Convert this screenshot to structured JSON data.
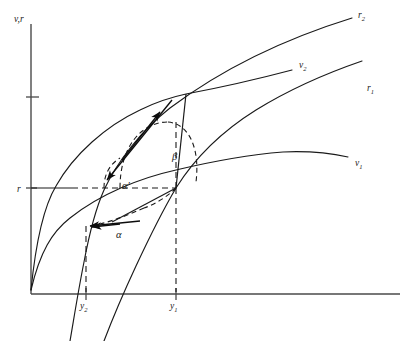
{
  "figure": {
    "type": "economics-line-diagram",
    "background_color": "#ffffff",
    "ink_color": "#1a1a1a",
    "axis_color": "#4a4a4a",
    "axes": {
      "y_axis_label": "v,r",
      "x_axis_label": "",
      "origin_label": ""
    },
    "y_ticks": [
      {
        "id": "tick-upper",
        "label": "",
        "y_px": 97
      },
      {
        "id": "tick-r",
        "label": "r",
        "y_px": 188
      }
    ],
    "x_ticks": [
      {
        "id": "tick-y2",
        "label_base": "y",
        "label_sub": "2",
        "x_px": 86
      },
      {
        "id": "tick-y1",
        "label_base": "y",
        "label_sub": "1",
        "x_px": 176
      }
    ],
    "curve_labels": [
      {
        "id": "curve-label-r2",
        "base": "r",
        "sub": "2",
        "x_px": 358,
        "y_px": 14
      },
      {
        "id": "curve-label-v2",
        "base": "v",
        "sub": "2",
        "x_px": 299,
        "y_px": 64
      },
      {
        "id": "curve-label-r1",
        "base": "r",
        "sub": "1",
        "x_px": 367,
        "y_px": 87
      },
      {
        "id": "curve-label-v1",
        "base": "v",
        "sub": "1",
        "x_px": 355,
        "y_px": 162
      }
    ],
    "angle_labels": [
      {
        "id": "angle-beta",
        "text": "β",
        "x_px": 172,
        "y_px": 156
      },
      {
        "id": "angle-alpha-prime",
        "text": "α′",
        "x_px": 122,
        "y_px": 185
      },
      {
        "id": "angle-alpha",
        "text": "α",
        "x_px": 116,
        "y_px": 234
      }
    ],
    "dashed_guides": [
      {
        "id": "guide-horizontal-r",
        "description": "horizontal line at r level"
      },
      {
        "id": "guide-vertical-y1",
        "description": "vertical dashed line at y1"
      },
      {
        "id": "guide-vertical-y2",
        "description": "vertical dashed line at y2"
      }
    ],
    "arrows": [
      {
        "id": "arrow-to-upper-intersection",
        "description": "arrow pointing up-right to upper intersection"
      },
      {
        "id": "arrow-to-lower-left",
        "description": "arrow pointing down-left along v2 curve"
      },
      {
        "id": "arrow-alpha-left",
        "description": "arrow pointing left to y2 point on v2"
      },
      {
        "id": "arrow-alpha-second",
        "description": "second short arrow left along alpha dashed path"
      }
    ]
  }
}
